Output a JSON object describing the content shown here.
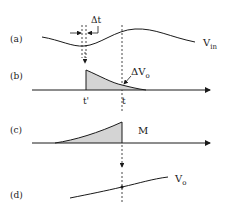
{
  "diagram": {
    "panels": [
      {
        "id": "a",
        "label": "(a)",
        "curve_label": "V",
        "curve_sub": "in"
      },
      {
        "id": "b",
        "label": "(b)",
        "annotation": "ΔV",
        "annotation_sub": "o",
        "tick_prime": "t'",
        "tick_t": "t"
      },
      {
        "id": "c",
        "label": "(c)",
        "curve_label": "M"
      },
      {
        "id": "d",
        "label": "(d)",
        "curve_label": "V",
        "curve_sub": "o"
      }
    ],
    "delta_t_label": "Δt",
    "colors": {
      "stroke": "#1a1a1a",
      "fill_shade": "#d4d4d4",
      "background": "#ffffff"
    }
  }
}
